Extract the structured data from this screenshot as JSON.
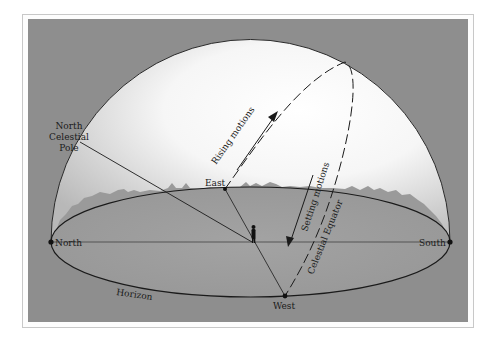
{
  "figure": {
    "type": "celestial-sphere-diagram",
    "colors": {
      "background_panel": "#8f8f8f",
      "ground": "#9a9a9a",
      "sky_light": "#ffffff",
      "sky_dark": "#bdbdbd",
      "lines": "#1a1a1a"
    },
    "labels": {
      "north_celestial_pole_line1": "North",
      "north_celestial_pole_line2": "Celestial",
      "north_celestial_pole_line3": "Pole",
      "rising_motions": "Rising motions",
      "setting_motions": "Setting motions",
      "celestial_equator": "Celestial Equator",
      "east": "East",
      "west": "West",
      "north": "North",
      "south": "South",
      "horizon": "Horizon"
    }
  }
}
